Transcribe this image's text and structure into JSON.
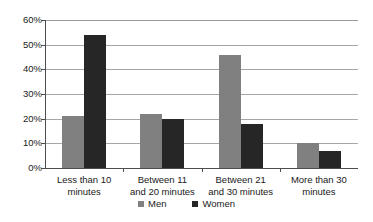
{
  "chart_data": {
    "type": "bar",
    "title": "",
    "subtitle": "",
    "xlabel": "",
    "ylabel": "",
    "ylim": [
      0,
      60
    ],
    "grid": true,
    "legend_position": "bottom",
    "categories": [
      "Less than 10 minutes",
      "Between 11 and 20 minutes",
      "Between 21 and 30 minutes",
      "More than 30 minutes"
    ],
    "category_lines": [
      [
        "Less than 10",
        "minutes"
      ],
      [
        "Between 11",
        "and 20 minutes"
      ],
      [
        "Between 21",
        "and 30 minutes"
      ],
      [
        "More than 30",
        "minutes"
      ]
    ],
    "series": [
      {
        "name": "Men",
        "color": "#808080",
        "values": [
          21,
          22,
          46,
          10
        ]
      },
      {
        "name": "Women",
        "color": "#262626",
        "values": [
          54,
          20,
          18,
          7
        ]
      }
    ],
    "y_ticks": [
      {
        "value": 60,
        "label": "60%"
      },
      {
        "value": 50,
        "label": "50%"
      },
      {
        "value": 40,
        "label": "40%"
      },
      {
        "value": 30,
        "label": "30%"
      },
      {
        "value": 20,
        "label": "20%"
      },
      {
        "value": 10,
        "label": "10%"
      },
      {
        "value": 0,
        "label": "0%"
      }
    ]
  },
  "axis": {
    "y_labels": [
      "60%",
      "50%",
      "40%",
      "30%",
      "20%",
      "10%",
      "0%"
    ],
    "tick_60": "60%",
    "tick_50": "50%",
    "tick_40": "40%",
    "tick_30": "30%",
    "tick_20": "20%",
    "tick_10": "10%",
    "tick_0": "0%"
  },
  "categories": {
    "c0_line1": "Less than 10",
    "c0_line2": "minutes",
    "c1_line1": "Between 11",
    "c1_line2": "and 20 minutes",
    "c2_line1": "Between 21",
    "c2_line2": "and 30 minutes",
    "c3_line1": "More than 30",
    "c3_line2": "minutes"
  },
  "legend": {
    "men_label": "Men",
    "women_label": "Women"
  },
  "colors": {
    "men": "#808080",
    "women": "#262626",
    "gridline": "#a6a6a6",
    "axis": "#4d4d4d",
    "background": "#ffffff",
    "text": "#1a1a1a"
  }
}
